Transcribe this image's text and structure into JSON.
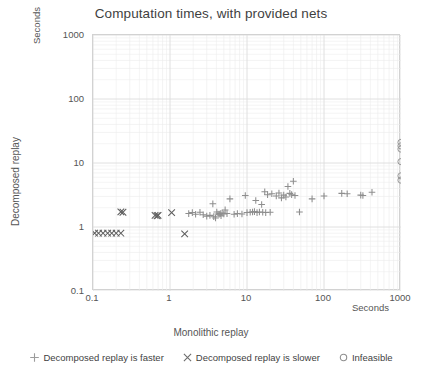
{
  "chart_data": {
    "type": "scatter",
    "title": "Computation times, with provided nets",
    "xlabel": "Monolithic replay",
    "ylabel": "Decomposed replay",
    "x_units": "Seconds",
    "y_units": "Seconds",
    "xscale": "log",
    "yscale": "log",
    "xlim": [
      0.1,
      1000
    ],
    "ylim": [
      0.1,
      1000
    ],
    "xticks": [
      "0.1",
      "1",
      "10",
      "100",
      "1000"
    ],
    "yticks": [
      "0.1",
      "1",
      "10",
      "100",
      "1000"
    ],
    "grid": true,
    "grid_minor": true,
    "legend_position": "bottom",
    "series": [
      {
        "name": "Decomposed replay is faster",
        "marker": "plus",
        "color": "#8e8e8e",
        "points": [
          [
            1.75,
            1.62
          ],
          [
            1.95,
            1.68
          ],
          [
            2.15,
            1.58
          ],
          [
            2.45,
            1.7
          ],
          [
            2.7,
            1.55
          ],
          [
            3.0,
            1.48
          ],
          [
            3.3,
            1.52
          ],
          [
            3.6,
            2.3
          ],
          [
            3.7,
            1.45
          ],
          [
            3.9,
            1.38
          ],
          [
            4.05,
            1.72
          ],
          [
            4.2,
            1.6
          ],
          [
            4.35,
            1.58
          ],
          [
            4.5,
            1.62
          ],
          [
            4.6,
            1.5
          ],
          [
            4.75,
            1.65
          ],
          [
            5.0,
            1.6
          ],
          [
            5.2,
            1.85
          ],
          [
            5.5,
            1.62
          ],
          [
            6.0,
            2.75
          ],
          [
            6.8,
            1.58
          ],
          [
            7.5,
            1.62
          ],
          [
            8.6,
            1.6
          ],
          [
            9.5,
            3.1
          ],
          [
            10.0,
            1.68
          ],
          [
            11.0,
            1.7
          ],
          [
            11.8,
            1.72
          ],
          [
            12.5,
            1.74
          ],
          [
            13.0,
            2.6
          ],
          [
            13.5,
            1.68
          ],
          [
            14.5,
            1.72
          ],
          [
            15.5,
            2.25
          ],
          [
            16.0,
            1.7
          ],
          [
            17.0,
            3.55
          ],
          [
            17.5,
            1.68
          ],
          [
            18.5,
            3.2
          ],
          [
            20.0,
            1.7
          ],
          [
            21.0,
            3.3
          ],
          [
            24.0,
            3.05
          ],
          [
            26.0,
            3.4
          ],
          [
            28.0,
            2.85
          ],
          [
            30.0,
            3.15
          ],
          [
            32.0,
            2.95
          ],
          [
            34.0,
            4.3
          ],
          [
            36.0,
            3.35
          ],
          [
            38.0,
            3.2
          ],
          [
            40.0,
            5.2
          ],
          [
            42.0,
            3.1
          ],
          [
            48.0,
            1.72
          ],
          [
            70.0,
            2.75
          ],
          [
            100.0,
            3.05
          ],
          [
            170.0,
            3.35
          ],
          [
            200.0,
            3.3
          ],
          [
            300.0,
            3.15
          ],
          [
            320.0,
            3.1
          ],
          [
            420.0,
            3.5
          ]
        ]
      },
      {
        "name": "Decomposed replay is slower",
        "marker": "cross",
        "color": "#5e5e5e",
        "points": [
          [
            0.105,
            0.8
          ],
          [
            0.118,
            0.8
          ],
          [
            0.135,
            0.8
          ],
          [
            0.155,
            0.8
          ],
          [
            0.175,
            0.8
          ],
          [
            0.2,
            0.8
          ],
          [
            0.23,
            0.8
          ],
          [
            0.23,
            1.72
          ],
          [
            0.245,
            1.7
          ],
          [
            0.64,
            1.52
          ],
          [
            0.68,
            1.5
          ],
          [
            0.7,
            1.52
          ],
          [
            1.05,
            1.68
          ],
          [
            1.55,
            0.78
          ]
        ]
      },
      {
        "name": "Infeasible",
        "marker": "circle",
        "color": "#9a9a9a",
        "points": [
          [
            1000,
            21.0
          ],
          [
            1000,
            18.5
          ],
          [
            1000,
            16.5
          ],
          [
            1000,
            10.5
          ],
          [
            1000,
            6.3
          ],
          [
            1000,
            5.4
          ]
        ]
      }
    ]
  },
  "legend": {
    "items": [
      {
        "label": "Decomposed replay is faster",
        "marker": "plus"
      },
      {
        "label": "Decomposed replay is slower",
        "marker": "cross"
      },
      {
        "label": "Infeasible",
        "marker": "circle"
      }
    ]
  },
  "colors": {
    "plot_border": "#d2d2d2",
    "grid_major": "#dcdcdc",
    "grid_minor": "#ededed",
    "text": "#404040"
  }
}
